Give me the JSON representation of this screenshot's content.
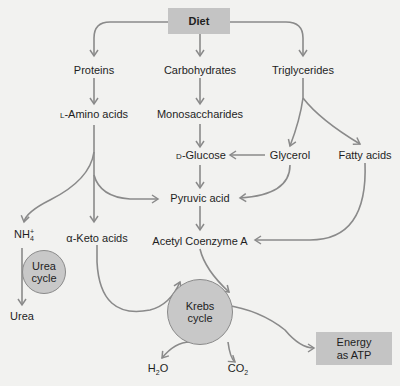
{
  "colors": {
    "background": "#f2f2f0",
    "box_fill": "#c4c4c4",
    "circle_fill": "#c8c8c8",
    "arrow": "#8a8a8a",
    "text": "#1e1e1e"
  },
  "nodes": {
    "diet": "Diet",
    "proteins": "Proteins",
    "carbohydrates": "Carbohydrates",
    "triglycerides": "Triglycerides",
    "amino_prefix": "L",
    "amino": "-Amino acids",
    "monosaccharides": "Monosaccharides",
    "glucose_prefix": "D",
    "glucose": "-Glucose",
    "glycerol": "Glycerol",
    "fatty_acids": "Fatty acids",
    "pyruvic_acid": "Pyruvic acid",
    "ammonium": "NH",
    "ammonium_sub": "4",
    "ammonium_sup": "+",
    "keto_acids": "α-Keto acids",
    "acetyl_coa": "Acetyl Coenzyme A",
    "urea_cycle_line1": "Urea",
    "urea_cycle_line2": "cycle",
    "urea": "Urea",
    "krebs_line1": "Krebs",
    "krebs_line2": "cycle",
    "water": "H",
    "water_sub": "2",
    "water_tail": "O",
    "co2": "CO",
    "co2_sub": "2",
    "energy_line1": "Energy",
    "energy_line2": "as ATP"
  },
  "edges": [
    [
      "Diet",
      "Proteins"
    ],
    [
      "Diet",
      "Carbohydrates"
    ],
    [
      "Diet",
      "Triglycerides"
    ],
    [
      "Proteins",
      "L-Amino acids"
    ],
    [
      "Carbohydrates",
      "Monosaccharides"
    ],
    [
      "Monosaccharides",
      "D-Glucose"
    ],
    [
      "Triglycerides",
      "Glycerol"
    ],
    [
      "Triglycerides",
      "Fatty acids"
    ],
    [
      "Glycerol",
      "D-Glucose"
    ],
    [
      "Glycerol",
      "Pyruvic acid"
    ],
    [
      "D-Glucose",
      "Pyruvic acid"
    ],
    [
      "L-Amino acids",
      "NH4+"
    ],
    [
      "L-Amino acids",
      "α-Keto acids"
    ],
    [
      "L-Amino acids",
      "Pyruvic acid"
    ],
    [
      "Pyruvic acid",
      "Acetyl Coenzyme A"
    ],
    [
      "Fatty acids",
      "Acetyl Coenzyme A"
    ],
    [
      "Acetyl Coenzyme A",
      "Krebs cycle"
    ],
    [
      "α-Keto acids",
      "Krebs cycle"
    ],
    [
      "NH4+",
      "Urea cycle"
    ],
    [
      "Urea cycle",
      "Urea"
    ],
    [
      "Krebs cycle",
      "H2O"
    ],
    [
      "Krebs cycle",
      "CO2"
    ],
    [
      "Krebs cycle",
      "Energy as ATP"
    ]
  ]
}
